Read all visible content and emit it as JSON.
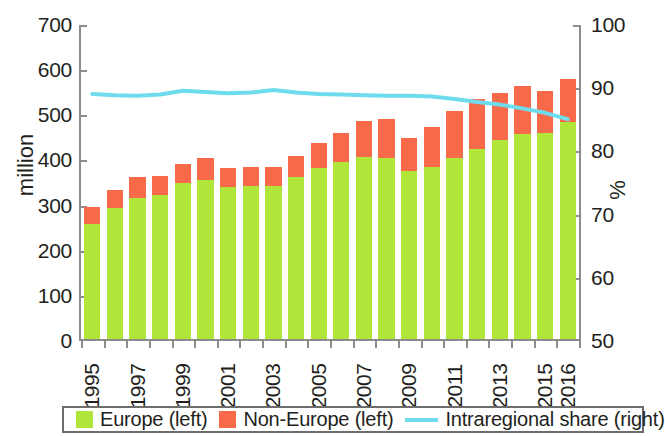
{
  "chart_data": {
    "type": "bar",
    "title": "",
    "subtitle": "",
    "xlabel": "",
    "ylabel": "million",
    "ylabel_right": "%",
    "ylim": [
      0,
      700
    ],
    "ylim_right": [
      50,
      100
    ],
    "yticks": [
      0,
      100,
      200,
      300,
      400,
      500,
      600,
      700
    ],
    "yticks_right": [
      50,
      60,
      70,
      80,
      90,
      100
    ],
    "grid": false,
    "legend_position": "bottom",
    "stacked": true,
    "categories": [
      "1995",
      "1996",
      "1997",
      "1998",
      "1999",
      "2000",
      "2001",
      "2002",
      "2003",
      "2004",
      "2005",
      "2006",
      "2007",
      "2008",
      "2009",
      "2010",
      "2011",
      "2012",
      "2013",
      "2014",
      "2015",
      "2016"
    ],
    "tick_labels": [
      "1995",
      "",
      "1997",
      "",
      "1999",
      "",
      "2001",
      "",
      "2003",
      "",
      "2005",
      "",
      "2007",
      "",
      "2009",
      "",
      "2011",
      "",
      "2013",
      "",
      "2015",
      "2016"
    ],
    "series": [
      {
        "name": "Europe (left)",
        "axis": "left",
        "type": "bar",
        "color": "#b0e539",
        "values": [
          255,
          290,
          312,
          320,
          345,
          352,
          337,
          340,
          338,
          360,
          378,
          392,
          404,
          400,
          373,
          380,
          400,
          422,
          440,
          454,
          456,
          480
        ]
      },
      {
        "name": "Non-Europe (left)",
        "axis": "left",
        "type": "bar",
        "color": "#f96a4a",
        "values": [
          38,
          40,
          46,
          42,
          43,
          48,
          42,
          40,
          42,
          46,
          56,
          64,
          78,
          88,
          72,
          90,
          106,
          110,
          104,
          106,
          93,
          97
        ]
      },
      {
        "name": "Intraregional share (right)",
        "axis": "right",
        "type": "line",
        "color": "#6fdcee",
        "values": [
          89.1,
          88.9,
          88.8,
          89.0,
          89.6,
          89.4,
          89.2,
          89.3,
          89.7,
          89.3,
          89.1,
          89.0,
          88.9,
          88.8,
          88.8,
          88.7,
          88.3,
          87.8,
          87.4,
          86.8,
          86.1,
          85.1
        ]
      }
    ],
    "totals": [
      293,
      330,
      358,
      362,
      388,
      400,
      379,
      380,
      380,
      406,
      434,
      456,
      482,
      488,
      445,
      470,
      506,
      532,
      544,
      560,
      549,
      577
    ]
  },
  "legend": {
    "items": [
      {
        "label": "Europe (left)",
        "marker": "square",
        "color": "#b0e539"
      },
      {
        "label": "Non-Europe (left)",
        "marker": "square",
        "color": "#f96a4a"
      },
      {
        "label": "Intraregional share (right)",
        "marker": "line",
        "color": "#6fdcee"
      }
    ]
  },
  "axes": {
    "left_title": "million",
    "right_title": "%"
  }
}
